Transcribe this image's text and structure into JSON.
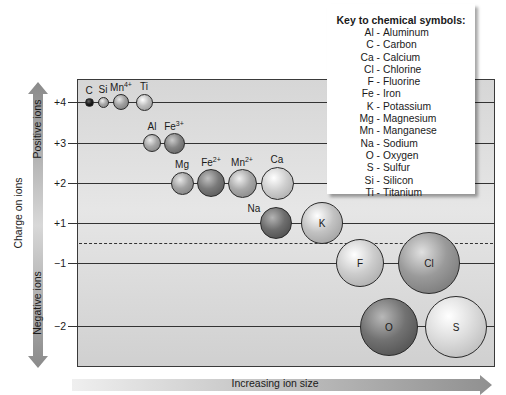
{
  "key": {
    "title": "Key to chemical symbols:",
    "entries": [
      {
        "symbol": "Al",
        "name": "Aluminum"
      },
      {
        "symbol": "C",
        "name": "Carbon"
      },
      {
        "symbol": "Ca",
        "name": "Calcium"
      },
      {
        "symbol": "Cl",
        "name": "Chlorine"
      },
      {
        "symbol": "F",
        "name": "Fluorine"
      },
      {
        "symbol": "Fe",
        "name": "Iron"
      },
      {
        "symbol": "K",
        "name": "Potassium"
      },
      {
        "symbol": "Mg",
        "name": "Magnesium"
      },
      {
        "symbol": "Mn",
        "name": "Manganese"
      },
      {
        "symbol": "Na",
        "name": "Sodium"
      },
      {
        "symbol": "O",
        "name": "Oxygen"
      },
      {
        "symbol": "S",
        "name": "Sulfur"
      },
      {
        "symbol": "Si",
        "name": "Silicon"
      },
      {
        "symbol": "Ti",
        "name": "Titanium"
      }
    ]
  },
  "axes": {
    "y_title": "Charge on ions",
    "y_positive": "Positive ions",
    "y_negative": "Negative ions",
    "x_title": "Increasing ion size",
    "y_ticks": [
      "+4",
      "+3",
      "+2",
      "+1",
      "−1",
      "−2"
    ]
  },
  "ions": [
    {
      "symbol": "C",
      "charge": "",
      "row": "+4",
      "cx": 89,
      "cy": 102,
      "r": 4.5,
      "color": "#1e1e1e",
      "label": "top"
    },
    {
      "symbol": "Si",
      "charge": "",
      "row": "+4",
      "cx": 103,
      "cy": 102,
      "r": 5.5,
      "color": "#a8a8a8",
      "label": "top"
    },
    {
      "symbol": "Mn",
      "charge": "4+",
      "row": "+4",
      "cx": 121,
      "cy": 102,
      "r": 8,
      "color": "#a0a0a0",
      "label": "top"
    },
    {
      "symbol": "Ti",
      "charge": "",
      "row": "+4",
      "cx": 144,
      "cy": 102,
      "r": 8.5,
      "color": "#bdbdbd",
      "label": "top"
    },
    {
      "symbol": "Al",
      "charge": "",
      "row": "+3",
      "cx": 152,
      "cy": 143,
      "r": 9,
      "color": "#a6a6a6",
      "label": "top"
    },
    {
      "symbol": "Fe",
      "charge": "3+",
      "row": "+3",
      "cx": 174,
      "cy": 143,
      "r": 10.5,
      "color": "#858585",
      "label": "top"
    },
    {
      "symbol": "Mg",
      "charge": "",
      "row": "+2",
      "cx": 182,
      "cy": 183,
      "r": 11.5,
      "color": "#a2a2a2",
      "label": "top"
    },
    {
      "symbol": "Fe",
      "charge": "2+",
      "row": "+2",
      "cx": 211,
      "cy": 183,
      "r": 14,
      "color": "#7a7a7a",
      "label": "top"
    },
    {
      "symbol": "Mn",
      "charge": "2+",
      "row": "+2",
      "cx": 242,
      "cy": 183,
      "r": 14.5,
      "color": "#a9a9a9",
      "label": "top"
    },
    {
      "symbol": "Ca",
      "charge": "",
      "row": "+2",
      "cx": 277,
      "cy": 183,
      "r": 16.5,
      "color": "#cfcfcf",
      "label": "top"
    },
    {
      "symbol": "Na",
      "charge": "",
      "row": "+1",
      "cx": 276,
      "cy": 223,
      "r": 16,
      "color": "#6e6e6e",
      "label": "left"
    },
    {
      "symbol": "K",
      "charge": "",
      "row": "+1",
      "cx": 322,
      "cy": 223,
      "r": 21,
      "color": "#c2c2c2",
      "label": "inside"
    },
    {
      "symbol": "F",
      "charge": "",
      "row": "−1",
      "cx": 360,
      "cy": 263,
      "r": 24,
      "color": "#cdcdcd",
      "label": "inside"
    },
    {
      "symbol": "Cl",
      "charge": "",
      "row": "−1",
      "cx": 429,
      "cy": 263,
      "r": 31,
      "color": "#9a9a9a",
      "label": "inside"
    },
    {
      "symbol": "O",
      "charge": "",
      "row": "−2",
      "cx": 389,
      "cy": 327,
      "r": 29,
      "color": "#727272",
      "label": "inside"
    },
    {
      "symbol": "S",
      "charge": "",
      "row": "−2",
      "cx": 456,
      "cy": 327,
      "r": 31,
      "color": "#dcdcdc",
      "label": "inside"
    }
  ],
  "chart_data": {
    "type": "scatter",
    "title": "",
    "xlabel": "Increasing ion size",
    "ylabel": "Charge on ions",
    "y_categories": [
      "+4",
      "+3",
      "+2",
      "+1",
      "-1",
      "-2"
    ],
    "series": [
      {
        "name": "+4",
        "ions": [
          "C",
          "Si",
          "Mn4+",
          "Ti"
        ],
        "relative_size": [
          1,
          1.2,
          1.8,
          1.9
        ]
      },
      {
        "name": "+3",
        "ions": [
          "Al",
          "Fe3+"
        ],
        "relative_size": [
          2.0,
          2.3
        ]
      },
      {
        "name": "+2",
        "ions": [
          "Mg",
          "Fe2+",
          "Mn2+",
          "Ca"
        ],
        "relative_size": [
          2.6,
          3.1,
          3.2,
          3.7
        ]
      },
      {
        "name": "+1",
        "ions": [
          "Na",
          "K"
        ],
        "relative_size": [
          3.6,
          4.7
        ]
      },
      {
        "name": "-1",
        "ions": [
          "F",
          "Cl"
        ],
        "relative_size": [
          5.3,
          6.9
        ]
      },
      {
        "name": "-2",
        "ions": [
          "O",
          "S"
        ],
        "relative_size": [
          6.4,
          6.9
        ]
      }
    ],
    "annotations": [
      "Positive ions",
      "Negative ions"
    ],
    "legend": "Key to chemical symbols (top right)"
  }
}
